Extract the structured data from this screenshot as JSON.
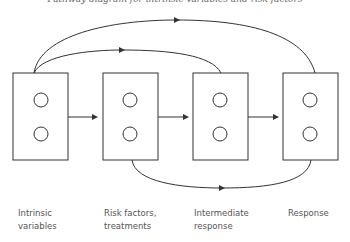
{
  "caption": "Pathway diagram for intrinsic variables and risk factors",
  "stages": [
    {
      "label_line1": "Intrinsic",
      "label_line2": "variables"
    },
    {
      "label_line1": "Risk factors,",
      "label_line2": "treatments"
    },
    {
      "label_line1": "Intermediate",
      "label_line2": "response"
    },
    {
      "label_line1": "Response",
      "label_line2": ""
    }
  ],
  "colors": {
    "stroke": "#333333",
    "text": "#555555"
  }
}
